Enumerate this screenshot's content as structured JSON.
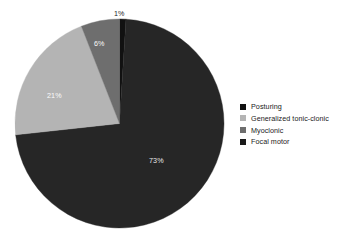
{
  "chart_data": {
    "type": "pie",
    "title": "",
    "categories": [
      "Posturing",
      "Generalized tonic-clonic",
      "Myoclonic",
      "Focal motor"
    ],
    "values": [
      1,
      21,
      6,
      73
    ],
    "value_labels": [
      "1%",
      "21%",
      "6%",
      "73%"
    ],
    "unit": "%",
    "legend_position": "right",
    "grid": false,
    "start_angle_deg": -90,
    "direction": "clockwise",
    "draw_order": [
      "Posturing",
      "Focal motor",
      "Generalized tonic-clonic",
      "Myoclonic"
    ],
    "colors": {
      "Posturing": "#111111",
      "Generalized tonic-clonic": "#b4b4b4",
      "Myoclonic": "#6e6e6e",
      "Focal motor": "#262626"
    },
    "slices": [
      {
        "label": "Posturing",
        "value": 1,
        "value_label": "1%",
        "color": "#111111",
        "label_position": "outside",
        "label_x": 114,
        "label_y": 10
      },
      {
        "label": "Focal motor",
        "value": 73,
        "value_label": "73%",
        "color": "#262626",
        "label_position": "inside",
        "label_x": 149,
        "label_y": 157
      },
      {
        "label": "Generalized tonic-clonic",
        "value": 21,
        "value_label": "21%",
        "color": "#b4b4b4",
        "label_position": "inside",
        "label_x": 47,
        "label_y": 92
      },
      {
        "label": "Myoclonic",
        "value": 6,
        "value_label": "6%",
        "color": "#6e6e6e",
        "label_position": "inside",
        "label_x": 94,
        "label_y": 40
      }
    ]
  },
  "legend": {
    "items": [
      {
        "label": "Posturing",
        "color": "#111111"
      },
      {
        "label": "Generalized tonic-clonic",
        "color": "#b4b4b4"
      },
      {
        "label": "Myoclonic",
        "color": "#6e6e6e"
      },
      {
        "label": "Focal motor",
        "color": "#1a1a1a"
      }
    ]
  },
  "background": "#ffffff"
}
